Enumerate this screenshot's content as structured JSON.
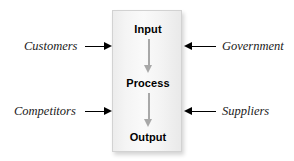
{
  "diagram": {
    "type": "input-process-output-flow",
    "background_color": "#ffffff",
    "box": {
      "fill_color": "#f4f4f4",
      "border_color": "#d2d2d2",
      "stages": [
        {
          "id": "input",
          "label": "Input"
        },
        {
          "id": "process",
          "label": "Process"
        },
        {
          "id": "output",
          "label": "Output"
        }
      ],
      "flow_arrow_color": "#a8a8a8",
      "flow_arrows": [
        {
          "from": "input",
          "to": "process",
          "direction": "down"
        },
        {
          "from": "process",
          "to": "output",
          "direction": "down"
        }
      ]
    },
    "external_inputs": [
      {
        "id": "customers",
        "label": "Customers",
        "side": "left",
        "arrow_direction": "right",
        "arrow_color": "#000000"
      },
      {
        "id": "competitors",
        "label": "Competitors",
        "side": "left",
        "arrow_direction": "right",
        "arrow_color": "#000000"
      },
      {
        "id": "government",
        "label": "Government",
        "side": "right",
        "arrow_direction": "left",
        "arrow_color": "#000000"
      },
      {
        "id": "suppliers",
        "label": "Suppliers",
        "side": "right",
        "arrow_direction": "left",
        "arrow_color": "#000000"
      }
    ]
  }
}
